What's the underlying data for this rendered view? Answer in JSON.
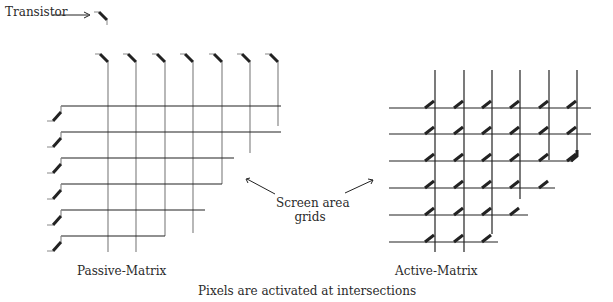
{
  "labels": {
    "transistor": "Transistor",
    "screen_area_line1": "Screen area",
    "screen_area_line2": "grids",
    "passive": "Passive-Matrix",
    "active": "Active-Matrix",
    "caption": "Pixels are activated at intersections"
  },
  "colors": {
    "line": "#222222",
    "grey_line": "#777777"
  },
  "passive": {
    "cols_x": [
      108,
      136,
      165,
      193,
      222,
      250,
      278
    ],
    "col_ends_y": [
      252,
      252,
      236,
      233,
      184,
      153,
      126
    ],
    "rows_y": [
      106,
      132,
      158,
      184,
      210,
      236
    ],
    "row_ends_x": [
      281,
      281,
      234,
      222,
      205,
      165
    ]
  },
  "active": {
    "cols_x": [
      435,
      464,
      492,
      520,
      549,
      577
    ],
    "col_ends_y": [
      252,
      252,
      234,
      199,
      160,
      150
    ],
    "rows_y": [
      108,
      134,
      161,
      188,
      215,
      242
    ],
    "row_ends_x": [
      591,
      591,
      573,
      555,
      528,
      498
    ]
  }
}
